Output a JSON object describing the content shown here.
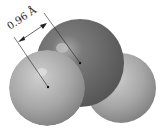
{
  "diagram": {
    "bond_length_label": "0.96 Å",
    "atoms": [
      {
        "name": "oxygen",
        "cx": 80,
        "cy": 63,
        "r": 44,
        "color": "#6e6e6e"
      },
      {
        "name": "hydrogen-left",
        "cx": 47,
        "cy": 88,
        "r": 38,
        "color": "#a4a4a4"
      },
      {
        "name": "hydrogen-right",
        "cx": 121,
        "cy": 88,
        "r": 35,
        "color": "#a4a4a4"
      }
    ]
  }
}
